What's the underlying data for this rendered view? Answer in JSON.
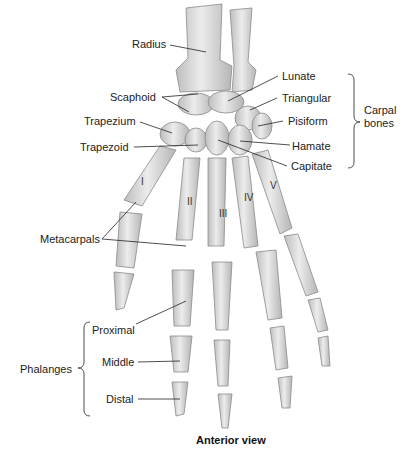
{
  "figure": {
    "caption": "Anterior view",
    "bone_fill": "#d9d9d9",
    "bone_stroke": "#8a8a8a",
    "leader_color": "#222222"
  },
  "labels": {
    "radius": "Radius",
    "scaphoid": "Scaphoid",
    "trapezium": "Trapezium",
    "trapezoid": "Trapezoid",
    "lunate": "Lunate",
    "triangular": "Triangular",
    "pisiform": "Pisiform",
    "hamate": "Hamate",
    "capitate": "Capitate",
    "metacarpals": "Metacarpals",
    "proximal": "Proximal",
    "middle": "Middle",
    "distal": "Distal"
  },
  "groups": {
    "carpal_line1": "Carpal",
    "carpal_line2": "bones",
    "phalanges": "Phalanges"
  },
  "metacarpal_numerals": [
    "I",
    "II",
    "III",
    "IV",
    "V"
  ]
}
